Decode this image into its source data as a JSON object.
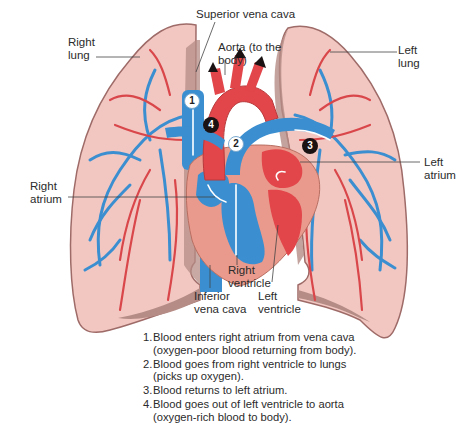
{
  "figure": {
    "type": "anatomical-diagram",
    "colors": {
      "lung_fill": "#f2c7c2",
      "lung_outline": "#9e6b68",
      "lung_inner_shadow": "#b58c86",
      "oxygen_poor_blue": "#3b8fd0",
      "oxygen_rich_red": "#e2454a",
      "heart_wall": "#e99a8d",
      "badge_dark": "#1a1213"
    }
  },
  "labels": {
    "superior_vena_cava": "Superior vena cava",
    "aorta": "Aorta (to the\nbody)",
    "right_lung": "Right\nlung",
    "left_lung": "Left\nlung",
    "right_atrium": "Right\natrium",
    "left_atrium": "Left\natrium",
    "right_ventricle": "Right\nventricle",
    "left_ventricle": "Left\nventricle",
    "inferior_vena_cava": "Inferior\nvena cava"
  },
  "badges": [
    {
      "number": "1",
      "style": "white"
    },
    {
      "number": "2",
      "style": "white"
    },
    {
      "number": "3",
      "style": "dark"
    },
    {
      "number": "4",
      "style": "dark"
    }
  ],
  "legend": {
    "items": [
      {
        "num": "1.",
        "text": "Blood enters right atrium from vena cava\n(oxygen-poor blood returning from body)."
      },
      {
        "num": "2.",
        "text": "Blood goes from right ventricle to lungs\n(picks up oxygen)."
      },
      {
        "num": "3.",
        "text": "Blood returns to left atrium."
      },
      {
        "num": "4.",
        "text": "Blood goes out of left ventricle to aorta\n(oxygen-rich blood to body)."
      }
    ]
  }
}
